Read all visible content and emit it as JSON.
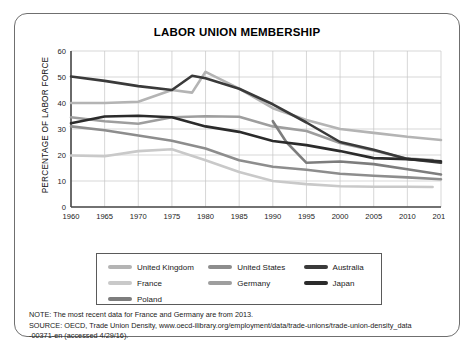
{
  "card": {
    "title": "LABOR UNION MEMBERSHIP"
  },
  "chart_data": {
    "type": "line",
    "title": "LABOR UNION MEMBERSHIP",
    "xlabel": "",
    "ylabel": "PERCENTAGE OF LABOR FORCE",
    "xlim": [
      1960,
      2014
    ],
    "ylim": [
      0,
      60
    ],
    "yticks": [
      0,
      10,
      20,
      30,
      40,
      50,
      60
    ],
    "xticks": [
      1960,
      1965,
      1970,
      1975,
      1980,
      1985,
      1990,
      1995,
      2000,
      2005,
      2010,
      2014
    ],
    "grid": true,
    "legend_position": "bottom",
    "series": [
      {
        "name": "United Kingdom",
        "color": "#b4b4b4",
        "x": [
          1960,
          1965,
          1970,
          1975,
          1978,
          1980,
          1985,
          1990,
          1995,
          2000,
          2005,
          2010,
          2014
        ],
        "values": [
          40.0,
          40.0,
          40.5,
          45.0,
          44.0,
          52.0,
          45.5,
          38.0,
          33.5,
          30.0,
          28.5,
          27.0,
          25.8
        ]
      },
      {
        "name": "United States",
        "color": "#8d8d8d",
        "x": [
          1960,
          1965,
          1970,
          1975,
          1980,
          1985,
          1990,
          1995,
          2000,
          2005,
          2010,
          2014
        ],
        "values": [
          31.0,
          29.5,
          27.5,
          25.5,
          22.5,
          18.0,
          15.5,
          14.3,
          12.8,
          12.0,
          11.4,
          10.7
        ]
      },
      {
        "name": "Australia",
        "color": "#3a3a3a",
        "x": [
          1960,
          1965,
          1970,
          1975,
          1978,
          1980,
          1985,
          1990,
          1995,
          2000,
          2005,
          2010,
          2014
        ],
        "values": [
          50.2,
          48.5,
          46.5,
          45.0,
          50.5,
          49.5,
          45.5,
          39.5,
          32.5,
          25.0,
          22.0,
          18.5,
          17.0
        ]
      },
      {
        "name": "France",
        "color": "#c9c9c9",
        "x": [
          1960,
          1965,
          1970,
          1975,
          1980,
          1985,
          1990,
          1995,
          2000,
          2005,
          2010,
          2013
        ],
        "values": [
          19.8,
          19.5,
          21.5,
          22.2,
          18.0,
          13.5,
          10.0,
          8.8,
          8.0,
          7.8,
          7.8,
          7.7
        ]
      },
      {
        "name": "Germany",
        "color": "#9e9e9e",
        "x": [
          1960,
          1965,
          1970,
          1975,
          1980,
          1985,
          1990,
          1995,
          2000,
          2005,
          2010,
          2013
        ],
        "values": [
          34.5,
          33.0,
          32.0,
          34.5,
          34.9,
          34.7,
          31.0,
          29.2,
          24.6,
          21.7,
          18.6,
          18.1
        ]
      },
      {
        "name": "Japan",
        "color": "#2b2b2b",
        "x": [
          1960,
          1965,
          1970,
          1975,
          1980,
          1985,
          1990,
          1995,
          2000,
          2005,
          2010,
          2014
        ],
        "values": [
          32.2,
          34.8,
          35.1,
          34.5,
          31.0,
          28.9,
          25.4,
          23.8,
          21.5,
          18.8,
          18.4,
          17.6
        ]
      },
      {
        "name": "Poland",
        "color": "#7d7d7d",
        "x": [
          1990,
          1992,
          1995,
          2000,
          2005,
          2010,
          2014
        ],
        "values": [
          33.0,
          25.0,
          17.0,
          17.5,
          16.5,
          14.5,
          12.5
        ]
      }
    ]
  },
  "legend": {
    "rows": [
      [
        {
          "label": "United Kingdom",
          "color": "#b4b4b4"
        },
        {
          "label": "United States",
          "color": "#8d8d8d"
        },
        {
          "label": "Australia",
          "color": "#3a3a3a"
        }
      ],
      [
        {
          "label": "France",
          "color": "#c9c9c9"
        },
        {
          "label": "Germany",
          "color": "#9e9e9e"
        },
        {
          "label": "Japan",
          "color": "#2b2b2b"
        }
      ],
      [
        {
          "label": "Poland",
          "color": "#7d7d7d"
        }
      ]
    ]
  },
  "notes": {
    "note": "NOTE: The most recent data for France and Germany are from 2013.",
    "source_line1": "SOURCE: OECD, Trade Union Density, www.oecd-ilibrary.org/employment/data/trade-unions/trade-union-density_data",
    "source_line2": "-00371-en (accessed 4/29/16)."
  }
}
